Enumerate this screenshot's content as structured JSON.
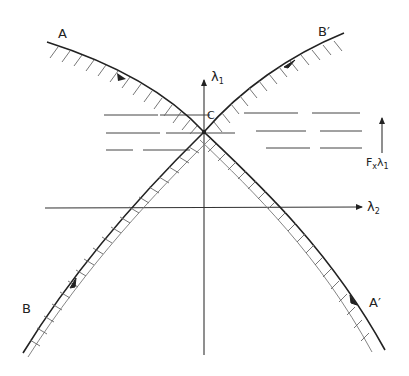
{
  "diagram": {
    "colors": {
      "ink": "#222222",
      "hatch": "#555555",
      "dash": "#444444",
      "background": "#ffffff"
    },
    "center_label": "C",
    "axes": {
      "vertical": {
        "label": "λ",
        "subscript": "1"
      },
      "horizontal": {
        "label": "λ",
        "subscript": "2"
      }
    },
    "curves": [
      {
        "id": "A",
        "label": "A",
        "direction": "toward C then continues to A′",
        "hatching": "single-side above"
      },
      {
        "id": "A_prime",
        "label": "A′",
        "hatching": "double-line cross-hatched"
      },
      {
        "id": "B",
        "label": "B",
        "direction": "toward C then continues to B′",
        "hatching": "double-line cross-hatched"
      },
      {
        "id": "B_prime",
        "label": "B′",
        "hatching": "single-side below"
      }
    ],
    "dashed_lines_count": 3,
    "side_arrow": {
      "label": "F",
      "label_subscript": "x",
      "symbol": "λ",
      "symbol_subscript": "1",
      "direction": "up"
    }
  }
}
